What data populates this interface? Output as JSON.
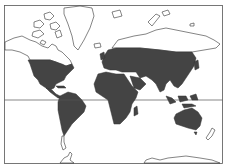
{
  "map": {
    "type": "world-distribution-map",
    "projection": "mercator-like",
    "colors": {
      "range_fill": "#444444",
      "land_outline": "#333333",
      "background": "#ffffff",
      "frame": "#555555"
    },
    "reference_lines": [
      "equator"
    ],
    "shaded_regions": [
      "United States and Mexico",
      "Central America and Caribbean",
      "South America (except southern tip)",
      "Europe",
      "Africa",
      "Middle East",
      "Asia (mid-latitudes)",
      "Southeast Asia and Indonesia",
      "Australia"
    ],
    "unshaded_regions": [
      "Canada and Arctic islands",
      "Greenland",
      "Northern Siberia",
      "Antarctica",
      "New Zealand",
      "Southern Patagonia"
    ]
  }
}
